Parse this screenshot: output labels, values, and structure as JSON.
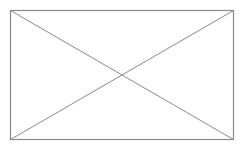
{
  "placeholder": {
    "type": "image-placeholder",
    "stroke_color": "#8a8a8a",
    "background_color": "#ffffff",
    "rect": {
      "x1": 10.5,
      "y1": 10.5,
      "x2": 233.5,
      "y2": 139.5
    }
  }
}
